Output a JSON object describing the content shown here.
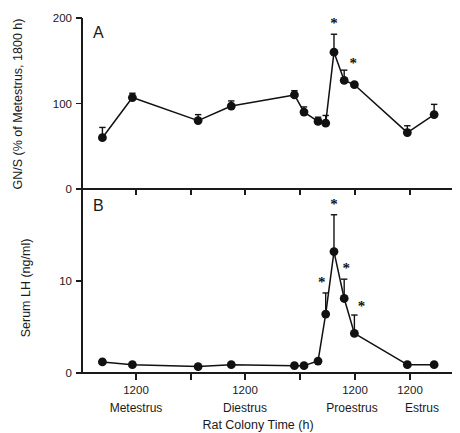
{
  "figure": {
    "xlabel": "Rat Colony Time (h)",
    "stage_labels": [
      "Metestrus",
      "Diestrus",
      "Proestrus",
      "Estrus"
    ],
    "xtick_label": "1200",
    "significance_marker": "*"
  },
  "chart_data": [
    {
      "type": "line",
      "panel": "A",
      "title": "",
      "ylabel": "GN/S (% of Metestrus, 1800 h)",
      "xlabel": "Rat Colony Time (h)",
      "ylim": [
        0,
        200
      ],
      "yticks": [
        0,
        100,
        200
      ],
      "yticklabels": [
        "0",
        "100",
        "200"
      ],
      "xlim": [
        0,
        4.5
      ],
      "xticks": [
        0.5,
        1.5,
        2.5,
        3.5
      ],
      "xticklabels": [
        "1200",
        "1200",
        "1200",
        "1200"
      ],
      "grid": false,
      "legend": "none",
      "points": [
        {
          "x": 0.52,
          "y": 60,
          "err": 12,
          "sig": false
        },
        {
          "x": 0.99,
          "y": 107,
          "err": 5,
          "sig": false
        },
        {
          "x": 2.02,
          "y": 80,
          "err": 7,
          "sig": false
        },
        {
          "x": 2.54,
          "y": 97,
          "err": 6,
          "sig": false
        },
        {
          "x": 3.53,
          "y": 110,
          "err": 5,
          "sig": false
        },
        {
          "x": 3.68,
          "y": 90,
          "err": 6,
          "sig": false
        },
        {
          "x": 3.9,
          "y": 79,
          "err": 5,
          "sig": false
        },
        {
          "x": 4.02,
          "y": 77,
          "err": 9,
          "sig": false
        },
        {
          "x": 4.15,
          "y": 160,
          "err": 21,
          "sig": true
        },
        {
          "x": 4.31,
          "y": 127,
          "err": 12,
          "sig": true
        },
        {
          "x": 4.47,
          "y": 122,
          "err": 0,
          "sig": false
        },
        {
          "x": 5.3,
          "y": 66,
          "err": 8,
          "sig": false
        },
        {
          "x": 5.72,
          "y": 87,
          "err": 12,
          "sig": false
        }
      ]
    },
    {
      "type": "line",
      "panel": "B",
      "title": "",
      "ylabel": "Serum LH (ng/ml)",
      "xlabel": "Rat Colony Time (h)",
      "ylim": [
        0,
        20
      ],
      "yticks": [
        0,
        10,
        20
      ],
      "yticklabels": [
        "0",
        "10",
        "20"
      ],
      "grid": false,
      "legend": "none",
      "points": [
        {
          "x": 0.52,
          "y": 1.2,
          "err": 0.0,
          "sig": false
        },
        {
          "x": 0.99,
          "y": 0.9,
          "err": 0.0,
          "sig": false
        },
        {
          "x": 2.02,
          "y": 0.7,
          "err": 0.0,
          "sig": false
        },
        {
          "x": 2.54,
          "y": 0.9,
          "err": 0.0,
          "sig": false
        },
        {
          "x": 3.53,
          "y": 0.8,
          "err": 0.0,
          "sig": false
        },
        {
          "x": 3.68,
          "y": 0.8,
          "err": 0.0,
          "sig": false
        },
        {
          "x": 3.9,
          "y": 1.3,
          "err": 0.0,
          "sig": false
        },
        {
          "x": 4.02,
          "y": 6.4,
          "err": 2.3,
          "sig": true
        },
        {
          "x": 4.15,
          "y": 13.2,
          "err": 4.0,
          "sig": true
        },
        {
          "x": 4.31,
          "y": 8.1,
          "err": 2.1,
          "sig": true
        },
        {
          "x": 4.47,
          "y": 4.3,
          "err": 2.0,
          "sig": true
        },
        {
          "x": 5.3,
          "y": 0.9,
          "err": 0.0,
          "sig": false
        },
        {
          "x": 5.72,
          "y": 0.9,
          "err": 0.0,
          "sig": false
        }
      ]
    }
  ]
}
